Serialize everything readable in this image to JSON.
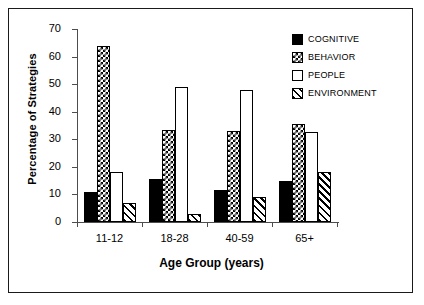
{
  "chart_data": {
    "type": "bar",
    "title": "",
    "xlabel": "Age Group (years)",
    "ylabel": "Percentage of Strategies",
    "categories": [
      "11-12",
      "18-28",
      "40-59",
      "65+"
    ],
    "series": [
      {
        "name": "COGNITIVE",
        "pattern": "solid-black",
        "values": [
          11,
          15.5,
          11.5,
          15
        ]
      },
      {
        "name": "BEHAVIOR",
        "pattern": "checkered-dots",
        "values": [
          64,
          33.5,
          33,
          35.5
        ]
      },
      {
        "name": "PEOPLE",
        "pattern": "white-empty",
        "values": [
          18,
          49,
          48,
          32.5
        ]
      },
      {
        "name": "ENVIRONMENT",
        "pattern": "diagonal-hatch",
        "values": [
          7,
          3,
          9,
          18
        ]
      }
    ],
    "ylim": [
      0,
      70
    ],
    "yticks": [
      0,
      10,
      20,
      30,
      40,
      50,
      60,
      70
    ],
    "ytick_labels": [
      "0",
      "10",
      "20",
      "30",
      "40",
      "50",
      "60",
      "70"
    ],
    "grid": false,
    "legend_position": "top-right",
    "colors": {
      "line": "#000000",
      "axis": "#4d4d4d",
      "background": "#ffffff",
      "border": "#1a1a1a"
    }
  },
  "legend": {
    "items": [
      {
        "label": "COGNITIVE"
      },
      {
        "label": "BEHAVIOR"
      },
      {
        "label": "PEOPLE"
      },
      {
        "label": "ENVIRONMENT"
      }
    ]
  }
}
